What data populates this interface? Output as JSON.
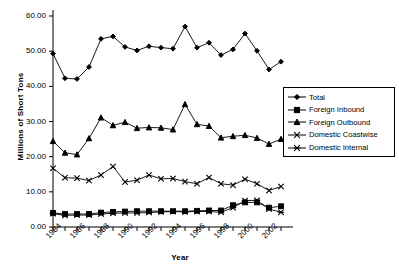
{
  "chart_data": {
    "type": "line",
    "title": "",
    "xlabel": "Year",
    "ylabel": "Millions of Short Tons",
    "ylim": [
      0,
      60
    ],
    "yticks": [
      "0.00",
      "10.00",
      "20.00",
      "30.00",
      "40.00",
      "50.00",
      "60.00"
    ],
    "ytick_values": [
      0,
      10,
      20,
      30,
      40,
      50,
      60
    ],
    "grid": false,
    "legend_position": "right",
    "x": [
      1984,
      1985,
      1986,
      1987,
      1988,
      1989,
      1990,
      1991,
      1992,
      1993,
      1994,
      1995,
      1996,
      1997,
      1998,
      1999,
      2000,
      2001,
      2002,
      2003
    ],
    "xtick_labels": [
      "1984",
      "1986",
      "1988",
      "1990",
      "1992",
      "1994",
      "1996",
      "1998",
      "2000",
      "2002"
    ],
    "xtick_values": [
      1984,
      1986,
      1988,
      1990,
      1992,
      1994,
      1996,
      1998,
      2000,
      2002
    ],
    "series": [
      {
        "name": "Total",
        "marker": "diamond",
        "values": [
          49.3,
          42.3,
          42.1,
          45.5,
          53.5,
          54.2,
          51.2,
          50.2,
          51.4,
          51.0,
          50.7,
          57.0,
          51.0,
          52.4,
          48.9,
          50.5,
          55.0,
          50.1,
          44.8,
          47.0
        ]
      },
      {
        "name": "Foreign Inbound",
        "marker": "square",
        "values": [
          4.0,
          3.7,
          3.7,
          3.7,
          4.1,
          4.3,
          4.4,
          4.5,
          4.5,
          4.5,
          4.5,
          4.5,
          4.6,
          4.7,
          4.7,
          6.2,
          7.0,
          7.0,
          5.5,
          5.9
        ]
      },
      {
        "name": "Foreign Outbound",
        "marker": "triangle",
        "values": [
          24.4,
          21.1,
          20.6,
          25.2,
          31.1,
          28.9,
          29.8,
          28.1,
          28.3,
          28.2,
          27.7,
          34.9,
          29.2,
          28.7,
          25.4,
          25.8,
          26.1,
          25.3,
          23.6,
          25.0
        ]
      },
      {
        "name": "Domestic Coastwise",
        "marker": "x",
        "values": [
          16.7,
          14.0,
          13.9,
          13.2,
          14.8,
          17.2,
          12.8,
          13.3,
          14.8,
          13.7,
          13.8,
          12.9,
          12.3,
          14.1,
          12.3,
          11.9,
          13.6,
          12.3,
          10.4,
          11.5
        ]
      },
      {
        "name": "Domestic Internal",
        "marker": "asterisk",
        "values": [
          3.8,
          3.3,
          3.4,
          3.4,
          3.7,
          3.9,
          4.0,
          4.0,
          4.1,
          4.3,
          4.4,
          4.3,
          4.4,
          4.4,
          4.2,
          5.5,
          7.5,
          7.6,
          5.1,
          4.2
        ]
      }
    ]
  },
  "legend": {
    "items": [
      {
        "label": "Total",
        "marker": "diamond"
      },
      {
        "label": "Foreign Inbound",
        "marker": "square"
      },
      {
        "label": "Foreign Outbound",
        "marker": "triangle"
      },
      {
        "label": "Domestic Coastwise",
        "marker": "x"
      },
      {
        "label": "Domestic Internal",
        "marker": "asterisk"
      }
    ]
  },
  "colors": {
    "series": "#000000",
    "axis": "#000000",
    "background": "#ffffff"
  }
}
